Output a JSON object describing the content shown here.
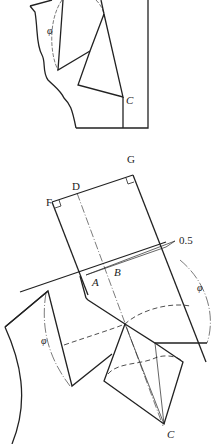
{
  "figure": {
    "top_panel": {
      "labels": {
        "C": "C",
        "phi": "φ",
        "partial_top": "A"
      }
    },
    "bottom_panel": {
      "labels": {
        "F": "F",
        "D": "D",
        "G": "G",
        "A": "A",
        "B": "B",
        "C": "C",
        "dim": "0.5",
        "phi_right": "φ",
        "phi_left": "φ"
      }
    },
    "colors": {
      "stroke": "#222222",
      "background": "#ffffff"
    }
  }
}
